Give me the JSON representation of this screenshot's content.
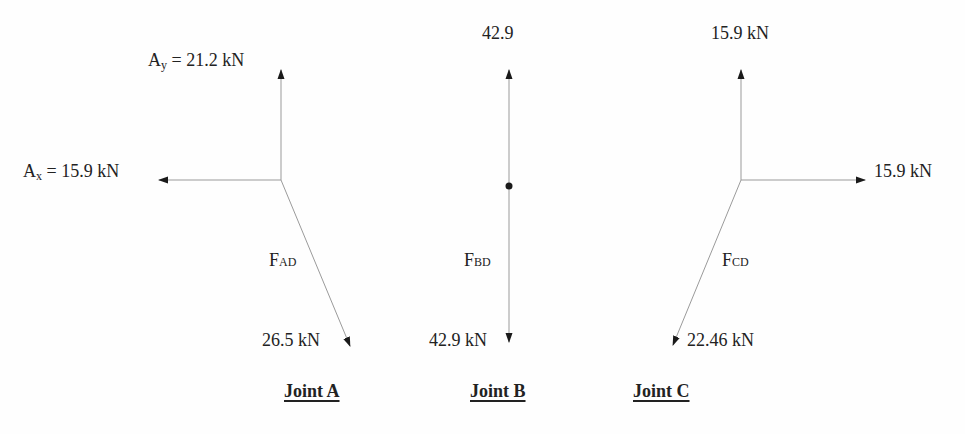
{
  "joints": [
    {
      "title": "Joint A",
      "forces": {
        "ay": {
          "symbol": "A",
          "sub": "y",
          "value": "= 21.2 kN"
        },
        "ax": {
          "symbol": "A",
          "sub": "x",
          "value": "= 15.9 kN"
        },
        "member": {
          "symbol": "F",
          "sub": "AD",
          "magnitude": "26.5 kN"
        }
      }
    },
    {
      "title": "Joint B",
      "forces": {
        "up": {
          "value": "42.9"
        },
        "member": {
          "symbol": "F",
          "sub": "BD",
          "magnitude": "42.9 kN"
        }
      }
    },
    {
      "title": "Joint C",
      "forces": {
        "up": {
          "value": "15.9 kN"
        },
        "right": {
          "value": "15.9 kN"
        },
        "member": {
          "symbol": "F",
          "sub": "CD",
          "magnitude": "22.46 kN"
        }
      }
    }
  ],
  "colors": {
    "line": "#9a9a9a",
    "arrowhead": "#1a1a1a",
    "text": "#222222"
  }
}
